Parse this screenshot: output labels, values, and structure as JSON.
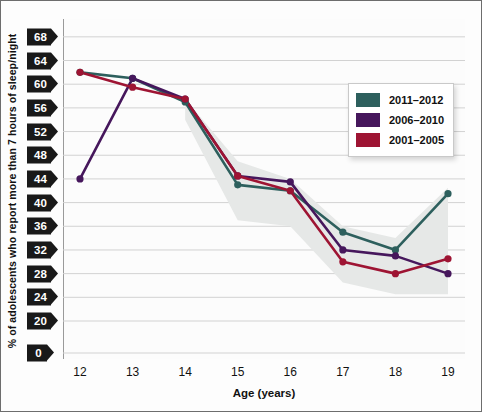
{
  "chart_data": {
    "type": "line",
    "title": "",
    "xlabel": "Age (years)",
    "ylabel": "% of adolescents who report more than 7 hours of sleep/night",
    "x": [
      12,
      13,
      14,
      15,
      16,
      17,
      18,
      19
    ],
    "categories": [
      "12",
      "13",
      "14",
      "15",
      "16",
      "17",
      "18",
      "19"
    ],
    "xlim": [
      12,
      19
    ],
    "ylim": [
      18,
      70
    ],
    "yticks": [
      0,
      20,
      24,
      28,
      32,
      36,
      40,
      44,
      48,
      52,
      56,
      60,
      64,
      68
    ],
    "ytick_labels": [
      "0",
      "20",
      "24",
      "28",
      "32",
      "36",
      "40",
      "44",
      "48",
      "52",
      "56",
      "60",
      "64",
      "68"
    ],
    "axis_break": true,
    "grid": true,
    "grid_axis": "y",
    "legend_position": "upper-right",
    "series": [
      {
        "name": "2011-2012",
        "color": "#2d5f5d",
        "values": [
          62.0,
          61.0,
          57.0,
          43.0,
          42.0,
          35.0,
          32.0,
          41.5
        ]
      },
      {
        "name": "2006-2010",
        "color": "#46175c",
        "values": [
          44.0,
          61.0,
          57.5,
          44.5,
          43.5,
          32.0,
          31.0,
          28.0
        ]
      },
      {
        "name": "2001-2005",
        "color": "#9e1433",
        "values": [
          62.0,
          59.5,
          57.5,
          44.5,
          42.0,
          30.0,
          28.0,
          30.5
        ]
      }
    ],
    "shaded_band": {
      "present": true,
      "color": "#e6e8e7",
      "x": [
        14,
        15,
        16,
        17,
        18,
        19
      ],
      "upper": [
        57.5,
        47.0,
        44.0,
        36.0,
        34.0,
        42.5
      ],
      "lower": [
        54.0,
        37.0,
        36.0,
        26.5,
        24.5,
        24.5
      ]
    }
  },
  "legend": {
    "items": [
      {
        "label": "2011–2012",
        "color": "#2d5f5d"
      },
      {
        "label": "2006–2010",
        "color": "#46175c"
      },
      {
        "label": "2001–2005",
        "color": "#9e1433"
      }
    ]
  },
  "axes": {
    "y_title": "% of adolescents who report more than 7 hours of sleep/night",
    "x_title": "Age (years)",
    "y_tick_labels": [
      "68",
      "64",
      "60",
      "56",
      "52",
      "48",
      "44",
      "40",
      "36",
      "32",
      "28",
      "24",
      "20",
      "0"
    ],
    "x_tick_labels": [
      "12",
      "13",
      "14",
      "15",
      "16",
      "17",
      "18",
      "19"
    ]
  },
  "colors": {
    "series_2011_2012": "#2d5f5d",
    "series_2006_2010": "#46175c",
    "series_2001_2005": "#9e1433",
    "band": "#e6e8e7",
    "grid": "#d2d2d2",
    "tick_flag": "#191919",
    "frame": "#6d6d6d"
  }
}
